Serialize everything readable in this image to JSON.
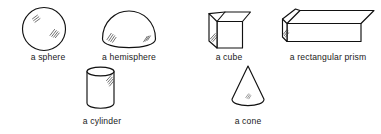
{
  "diagram": {
    "background_color": "#ffffff",
    "line_color": "#111111",
    "text_color": "#1a1a1a",
    "shapes": [
      {
        "id": "sphere",
        "label": "a sphere",
        "icon": "sphere-icon",
        "row": 1,
        "column": 1,
        "shading": "hatched highlight upper-left, hatched patch center-right"
      },
      {
        "id": "hemisphere",
        "label": "a hemisphere",
        "icon": "hemisphere-icon",
        "row": 1,
        "column": 2,
        "shading": "hatched patches lower-left and lower-right"
      },
      {
        "id": "cube",
        "label": "a cube",
        "icon": "cube-icon",
        "row": 1,
        "column": 3,
        "shading": "hatched patch on left face"
      },
      {
        "id": "rectangular-prism",
        "label": "a rectangular prism",
        "icon": "rectangular-prism-icon",
        "row": 1,
        "column": 4,
        "shading": "hatched patch on left end face"
      },
      {
        "id": "cylinder",
        "label": "a cylinder",
        "icon": "cylinder-icon",
        "row": 2,
        "column": 1,
        "shading": "hatched patch upper-right of body"
      },
      {
        "id": "cone",
        "label": "a cone",
        "icon": "cone-icon",
        "row": 2,
        "column": 2,
        "shading": "faint hatched patch near base center"
      }
    ]
  }
}
